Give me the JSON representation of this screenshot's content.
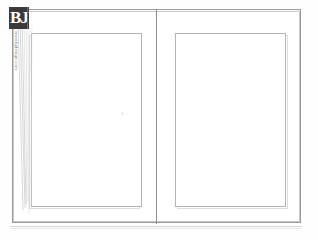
{
  "document": {
    "kind": "scanned-book-spread-template",
    "background_color": "#fefefe"
  },
  "logo": {
    "text": "BJ",
    "name": "bj-logo",
    "color": "#3a3a3a",
    "text_color": "#ffffff"
  },
  "vertical_caption": {
    "text": "www.bjdesign.com",
    "color": "#7d7d7d"
  },
  "frame": {
    "outer_border_color": "#9a9a9a",
    "inner_border_color": "#c9c9c9",
    "spine_color": "#8e8e8e"
  },
  "pages": {
    "left": {
      "label": "left-page",
      "content_border_color": "#b4b4b4",
      "content": ""
    },
    "right": {
      "label": "right-page",
      "content_border_color": "#b4b4b4",
      "content": ""
    }
  },
  "marks": {
    "speck_color": "#ededf2",
    "edge_line_color": "#bcbcbc",
    "base_rule_color": "#d5d5d5"
  }
}
